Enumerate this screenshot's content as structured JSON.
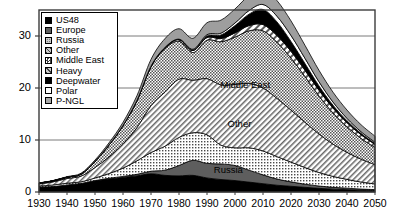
{
  "chart_data": {
    "type": "area",
    "stacked": true,
    "title": "",
    "subtitle": "",
    "xlabel": "",
    "ylabel": "",
    "xlim": [
      1930,
      2050
    ],
    "ylim": [
      0,
      35
    ],
    "xticks": [
      1930,
      1940,
      1950,
      1960,
      1970,
      1980,
      1990,
      2000,
      2010,
      2020,
      2030,
      2040,
      2050
    ],
    "yticks": [
      0,
      10,
      20,
      30
    ],
    "gridlines": "horizontal",
    "legend_position": "upper-left-inside",
    "x": [
      1930,
      1935,
      1940,
      1945,
      1950,
      1955,
      1960,
      1965,
      1970,
      1975,
      1980,
      1985,
      1990,
      1995,
      2000,
      2005,
      2010,
      2015,
      2020,
      2025,
      2030,
      2035,
      2040,
      2045,
      2050
    ],
    "series": [
      {
        "name": "US48",
        "pattern": "solid-black",
        "color": "#000000",
        "values": [
          0.9,
          1.0,
          1.3,
          1.6,
          2.1,
          2.5,
          2.8,
          3.1,
          3.5,
          3.2,
          3.1,
          3.2,
          2.7,
          2.4,
          2.2,
          1.9,
          1.6,
          1.3,
          1.1,
          0.9,
          0.7,
          0.55,
          0.45,
          0.35,
          0.28
        ]
      },
      {
        "name": "Europe",
        "pattern": "solid-dark-gray",
        "color": "#595959",
        "values": [
          0.05,
          0.05,
          0.05,
          0.05,
          0.1,
          0.15,
          0.2,
          0.3,
          0.5,
          1.0,
          2.0,
          2.9,
          2.8,
          3.0,
          2.9,
          2.3,
          1.7,
          1.2,
          0.85,
          0.6,
          0.45,
          0.35,
          0.28,
          0.22,
          0.18
        ]
      },
      {
        "name": "Russia",
        "pattern": "fine-dots",
        "color": "#d8d8d8",
        "values": [
          0.2,
          0.3,
          0.35,
          0.3,
          0.5,
          0.9,
          1.6,
          2.6,
          3.6,
          4.6,
          5.4,
          5.3,
          5.5,
          3.6,
          3.4,
          4.3,
          4.6,
          4.3,
          3.8,
          3.2,
          2.6,
          2.1,
          1.7,
          1.35,
          1.1
        ]
      },
      {
        "name": "Other",
        "pattern": "diagonal-hatch",
        "color": "#cfcfcf",
        "values": [
          0.4,
          0.6,
          0.9,
          1.1,
          2.0,
          3.2,
          4.6,
          6.4,
          9.0,
          10.4,
          11.2,
          10.1,
          10.8,
          11.6,
          12.2,
          12.4,
          12.1,
          11.2,
          10.0,
          8.7,
          7.4,
          6.2,
          5.2,
          4.4,
          3.7
        ]
      },
      {
        "name": "Middle East",
        "pattern": "checker",
        "color": "#c6c6c6",
        "values": [
          0.15,
          0.2,
          0.25,
          0.4,
          1.2,
          2.3,
          3.6,
          5.2,
          7.5,
          8.4,
          7.3,
          5.3,
          7.4,
          8.3,
          9.1,
          10.1,
          11.0,
          10.8,
          10.0,
          8.8,
          7.3,
          6.0,
          4.9,
          4.0,
          3.3
        ]
      },
      {
        "name": "Heavy",
        "pattern": "coarse-hatch",
        "color": "#d2d2d2",
        "values": [
          0,
          0,
          0,
          0,
          0,
          0,
          0,
          0.05,
          0.1,
          0.2,
          0.3,
          0.4,
          0.5,
          0.6,
          0.8,
          1.0,
          1.2,
          1.3,
          1.3,
          1.2,
          1.1,
          0.95,
          0.8,
          0.7,
          0.6
        ]
      },
      {
        "name": "Deepwater",
        "pattern": "solid-black",
        "color": "#000000",
        "values": [
          0,
          0,
          0,
          0,
          0,
          0,
          0,
          0,
          0,
          0,
          0.05,
          0.1,
          0.3,
          0.7,
          1.4,
          2.2,
          2.9,
          2.6,
          1.9,
          1.3,
          0.85,
          0.55,
          0.38,
          0.26,
          0.18
        ]
      },
      {
        "name": "Polar",
        "pattern": "white",
        "color": "#ffffff",
        "values": [
          0,
          0,
          0,
          0,
          0,
          0,
          0,
          0,
          0,
          0,
          0.05,
          0.15,
          0.25,
          0.35,
          0.5,
          0.7,
          0.95,
          1.1,
          1.15,
          1.0,
          0.8,
          0.6,
          0.45,
          0.32,
          0.24
        ]
      },
      {
        "name": "P-NGL",
        "pattern": "light-gray",
        "color": "#9e9e9e",
        "values": [
          0.05,
          0.05,
          0.1,
          0.15,
          0.25,
          0.4,
          0.6,
          0.9,
          1.3,
          1.7,
          2.0,
          2.1,
          2.3,
          2.5,
          2.7,
          2.9,
          3.1,
          3.0,
          2.8,
          2.5,
          2.2,
          1.9,
          1.6,
          1.35,
          1.15
        ]
      }
    ],
    "inline_labels": [
      {
        "text": "Middle East",
        "x": 2005,
        "y": 20.5
      },
      {
        "text": "Other",
        "x": 2002,
        "y": 13.0
      },
      {
        "text": "Russia",
        "x": 1998,
        "y": 4.3
      }
    ]
  },
  "legend": {
    "items": [
      {
        "label": "US48",
        "pattern": "solid-black"
      },
      {
        "label": "Europe",
        "pattern": "solid-dark-gray"
      },
      {
        "label": "Russia",
        "pattern": "fine-dots"
      },
      {
        "label": "Other",
        "pattern": "diagonal-hatch"
      },
      {
        "label": "Middle East",
        "pattern": "checker"
      },
      {
        "label": "Heavy",
        "pattern": "coarse-hatch"
      },
      {
        "label": "Deepwater",
        "pattern": "solid-black"
      },
      {
        "label": "Polar",
        "pattern": "white"
      },
      {
        "label": "P-NGL",
        "pattern": "light-gray"
      }
    ]
  },
  "axes": {
    "yticks": [
      "0",
      "10",
      "20",
      "30"
    ],
    "xticks": [
      "1930",
      "1940",
      "1950",
      "1960",
      "1970",
      "1980",
      "1990",
      "2000",
      "2010",
      "2020",
      "2030",
      "2040",
      "2050"
    ]
  },
  "colors": {
    "frame": "#3c3c3c",
    "gridline": "#6b6b6b",
    "text": "#000000",
    "background": "#ffffff"
  }
}
